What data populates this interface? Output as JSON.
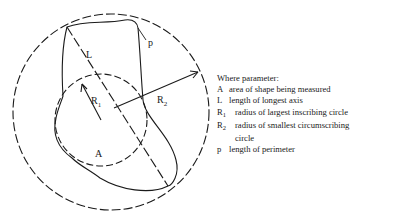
{
  "figure": {
    "labels": {
      "L": "L",
      "p": "p",
      "R1": "R",
      "R1_sub": "1",
      "R2": "R",
      "R2_sub": "2",
      "A": "A"
    },
    "colors": {
      "line": "#1a1a1a",
      "background": "#ffffff"
    }
  },
  "legend": {
    "title": "Where parameter:",
    "items": [
      {
        "symbol": "A",
        "sub": "",
        "text": "area of shape being measured"
      },
      {
        "symbol": "L",
        "sub": "",
        "text": "length of longest axis"
      },
      {
        "symbol": "R",
        "sub": "1",
        "text": "radius of largest inscribing circle"
      },
      {
        "symbol": "R",
        "sub": "2",
        "text": "radius of smallest circumscribing",
        "continuation": "circle"
      },
      {
        "symbol": "p",
        "sub": "",
        "text": "length of perimeter"
      }
    ]
  }
}
